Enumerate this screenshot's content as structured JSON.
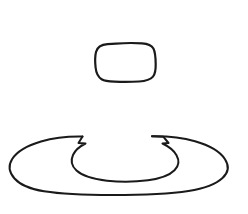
{
  "canvas": {
    "width": 248,
    "height": 214,
    "background_color": "#ffffff",
    "stroke_color": "#1a1a1a",
    "style": "hand-drawn line sketch",
    "title": "Hand-drawn sketch of a rounded rectangle above a ring shape"
  },
  "shapes": {
    "upper": {
      "name": "rounded-rectangle",
      "label": "rounded rectangle outline",
      "stroke_width": 2.2,
      "bbox": {
        "x": 95,
        "y": 43,
        "width": 61,
        "height": 39
      },
      "path": "M 107.5 44.2 C 101.5 44.6 97.2 47.4 96.0 52.0 C 94.9 56.4 95.0 62.0 95.6 67.5 C 96.1 72.6 98.0 76.9 101.6 79.2 C 104.4 81.0 109.0 81.5 114.5 81.7 C 122.5 82.0 131.5 82.0 139.0 81.5 C 145.5 81.0 150.3 79.7 153.0 76.6 C 155.3 73.9 155.8 69.5 155.7 64.0 C 155.6 58.0 155.2 52.0 153.4 48.6 C 151.6 45.3 147.5 43.8 142.0 43.4 C 134.0 42.8 124.0 43.0 116.0 43.6 C 113.0 43.85 110.0 44.05 107.5 44.2 Z"
    },
    "lower": {
      "name": "ring-with-gap",
      "label": "ring / annulus outline with gap at top center",
      "stroke_width": 2.0,
      "bbox": {
        "x": 9,
        "y": 130,
        "width": 228,
        "height": 65
      },
      "outer_path": "M 82.5 136.5 C 68.0 136.2 53.5 137.8 41.0 141.5 C 27.5 145.5 17.0 151.5 12.2 159.0 C 8.0 165.6 9.2 172.5 14.5 178.5 C 20.5 185.2 31.0 189.2 44.0 191.3 C 62.0 194.2 86.0 195.0 112.0 195.0 C 141.0 195.0 168.0 194.2 188.5 191.0 C 203.5 188.6 215.5 184.5 222.5 178.0 C 228.5 172.4 229.2 165.6 225.0 159.2 C 220.0 151.5 209.0 145.3 195.0 141.3 C 182.0 137.6 167.0 136.0 152.0 136.3",
      "inner_path": "M 82.5 136.5 L 78.5 143.0 L 85.5 143.5 C 79.5 146.5 75.0 150.5 73.0 155.0 C 70.5 160.5 71.5 166.0 76.5 170.5 C 82.5 175.9 93.5 179.2 107.0 180.7 C 120.0 182.1 135.0 182.0 148.0 180.3 C 160.0 178.7 169.5 175.3 174.5 170.3 C 179.0 165.8 179.5 160.5 176.5 155.2 C 174.0 150.7 169.0 146.6 162.5 143.5 L 168.5 143.0 L 163.5 136.8 L 152.0 136.3"
    }
  }
}
